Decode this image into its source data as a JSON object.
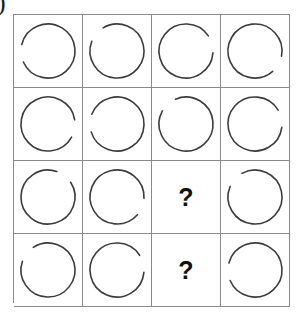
{
  "page": {
    "corner_mark": ")",
    "background_color": "#ffffff",
    "grid_line_color": "#8a8a8a",
    "arc_stroke_color": "#3c3c3c",
    "question_color": "#111111"
  },
  "puzzle": {
    "type": "matrix-reasoning",
    "rows": 4,
    "columns": 4,
    "question_label": "?",
    "cells": [
      {
        "row": 1,
        "col": 1,
        "kind": "arc",
        "gap_center_deg": 185,
        "gap_span_deg": 38,
        "radius": 27
      },
      {
        "row": 1,
        "col": 2,
        "kind": "arc",
        "gap_center_deg": 140,
        "gap_span_deg": 38,
        "radius": 27
      },
      {
        "row": 1,
        "col": 3,
        "kind": "arc",
        "gap_center_deg": 15,
        "gap_span_deg": 38,
        "radius": 27
      },
      {
        "row": 1,
        "col": 4,
        "kind": "arc",
        "gap_center_deg": 330,
        "gap_span_deg": 38,
        "radius": 27
      },
      {
        "row": 2,
        "col": 1,
        "kind": "arc",
        "gap_center_deg": 350,
        "gap_span_deg": 38,
        "radius": 27
      },
      {
        "row": 2,
        "col": 2,
        "kind": "arc",
        "gap_center_deg": 178,
        "gap_span_deg": 38,
        "radius": 27
      },
      {
        "row": 2,
        "col": 3,
        "kind": "arc",
        "gap_center_deg": 132,
        "gap_span_deg": 38,
        "radius": 27
      },
      {
        "row": 2,
        "col": 4,
        "kind": "arc",
        "gap_center_deg": 12,
        "gap_span_deg": 38,
        "radius": 27
      },
      {
        "row": 3,
        "col": 1,
        "kind": "arc",
        "gap_center_deg": 52,
        "gap_span_deg": 38,
        "radius": 27
      },
      {
        "row": 3,
        "col": 2,
        "kind": "arc",
        "gap_center_deg": 338,
        "gap_span_deg": 38,
        "radius": 27
      },
      {
        "row": 3,
        "col": 3,
        "kind": "question"
      },
      {
        "row": 3,
        "col": 4,
        "kind": "arc",
        "gap_center_deg": 138,
        "gap_span_deg": 38,
        "radius": 27
      },
      {
        "row": 4,
        "col": 1,
        "kind": "arc",
        "gap_center_deg": 142,
        "gap_span_deg": 38,
        "radius": 27
      },
      {
        "row": 4,
        "col": 2,
        "kind": "arc",
        "gap_center_deg": 14,
        "gap_span_deg": 38,
        "radius": 27
      },
      {
        "row": 4,
        "col": 3,
        "kind": "question"
      },
      {
        "row": 4,
        "col": 4,
        "kind": "arc",
        "gap_center_deg": 184,
        "gap_span_deg": 38,
        "radius": 27
      }
    ]
  }
}
